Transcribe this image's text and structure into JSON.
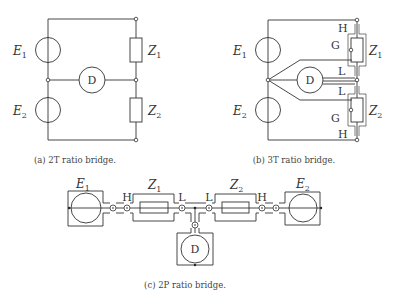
{
  "figures": {
    "a": {
      "caption": "(a) 2T ratio bridge.",
      "labels": {
        "E1": "E",
        "E1_sub": "1",
        "E2": "E",
        "E2_sub": "2",
        "Z1": "Z",
        "Z1_sub": "1",
        "Z2": "Z",
        "Z2_sub": "2",
        "D": "D"
      }
    },
    "b": {
      "caption": "(b) 3T ratio bridge.",
      "labels": {
        "E1": "E",
        "E1_sub": "1",
        "E2": "E",
        "E2_sub": "2",
        "Z1": "Z",
        "Z1_sub": "1",
        "Z2": "Z",
        "Z2_sub": "2",
        "D": "D",
        "H_top": "H",
        "G_top": "G",
        "L_top": "L",
        "L_bot": "L",
        "G_bot": "G",
        "H_bot": "H"
      }
    },
    "c": {
      "caption": "(c) 2P ratio bridge.",
      "labels": {
        "E1": "E",
        "E1_sub": "1",
        "E2": "E",
        "E2_sub": "2",
        "Z1": "Z",
        "Z1_sub": "1",
        "Z2": "Z",
        "Z2_sub": "2",
        "D": "D",
        "H_left": "H",
        "L_left": "L",
        "L_right": "L",
        "H_right": "H"
      }
    }
  }
}
